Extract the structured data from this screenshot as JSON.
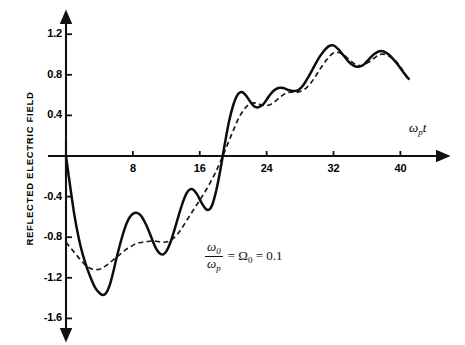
{
  "chart_data": {
    "type": "line",
    "title": "",
    "xlabel": "ω₟t",
    "ylabel": "REFLECTED ELECTRIC FIELD",
    "xlim": [
      0,
      42
    ],
    "ylim": [
      -1.7,
      1.35
    ],
    "grid": false,
    "legend": "none",
    "xticks": [
      8,
      16,
      24,
      32,
      40
    ],
    "xtick_labels": [
      "8",
      "16",
      "24",
      "32",
      "40"
    ],
    "yticks": [
      1.2,
      0.8,
      0.4,
      -0.4,
      -0.8,
      -1.2,
      -1.6
    ],
    "ytick_labels": [
      "1.2",
      "0.8",
      "0.4",
      "-0.4",
      "-0.8",
      "-1.2",
      "-1.6"
    ],
    "annotations": [
      {
        "text": "ω₀/ωₚ = Ω₀ = 0.1",
        "numerator": "ω",
        "numerator_sub": "0",
        "denominator": "ω",
        "denominator_sub": "p",
        "rest": "= Ω",
        "rest_sub": "0",
        "value": "= 0.1",
        "x": 0.49,
        "y": 0.72
      }
    ],
    "series": [
      {
        "name": "solid",
        "style": "solid",
        "points": [
          [
            0.0,
            0.0
          ],
          [
            0.5,
            -0.3
          ],
          [
            1.0,
            -0.58
          ],
          [
            1.5,
            -0.8
          ],
          [
            2.0,
            -0.97
          ],
          [
            2.5,
            -1.1
          ],
          [
            3.0,
            -1.21
          ],
          [
            3.5,
            -1.3
          ],
          [
            4.0,
            -1.35
          ],
          [
            4.4,
            -1.37
          ],
          [
            4.8,
            -1.35
          ],
          [
            5.2,
            -1.28
          ],
          [
            5.6,
            -1.16
          ],
          [
            6.0,
            -1.02
          ],
          [
            6.5,
            -0.86
          ],
          [
            7.0,
            -0.72
          ],
          [
            7.5,
            -0.62
          ],
          [
            8.0,
            -0.57
          ],
          [
            8.5,
            -0.56
          ],
          [
            9.0,
            -0.59
          ],
          [
            9.6,
            -0.68
          ],
          [
            10.2,
            -0.8
          ],
          [
            10.7,
            -0.9
          ],
          [
            11.2,
            -0.96
          ],
          [
            11.6,
            -0.97
          ],
          [
            12.0,
            -0.94
          ],
          [
            12.5,
            -0.85
          ],
          [
            13.0,
            -0.72
          ],
          [
            13.5,
            -0.58
          ],
          [
            14.0,
            -0.45
          ],
          [
            14.4,
            -0.37
          ],
          [
            14.8,
            -0.33
          ],
          [
            15.2,
            -0.33
          ],
          [
            15.7,
            -0.38
          ],
          [
            16.2,
            -0.46
          ],
          [
            16.7,
            -0.52
          ],
          [
            17.1,
            -0.53
          ],
          [
            17.5,
            -0.48
          ],
          [
            18.0,
            -0.33
          ],
          [
            18.5,
            -0.12
          ],
          [
            19.0,
            0.12
          ],
          [
            19.5,
            0.34
          ],
          [
            20.0,
            0.5
          ],
          [
            20.5,
            0.6
          ],
          [
            21.0,
            0.63
          ],
          [
            21.5,
            0.6
          ],
          [
            22.0,
            0.54
          ],
          [
            22.5,
            0.49
          ],
          [
            23.0,
            0.48
          ],
          [
            23.6,
            0.51
          ],
          [
            24.2,
            0.58
          ],
          [
            24.8,
            0.64
          ],
          [
            25.4,
            0.67
          ],
          [
            26.0,
            0.67
          ],
          [
            26.6,
            0.65
          ],
          [
            27.2,
            0.64
          ],
          [
            27.8,
            0.65
          ],
          [
            28.4,
            0.7
          ],
          [
            29.0,
            0.78
          ],
          [
            29.6,
            0.87
          ],
          [
            30.2,
            0.96
          ],
          [
            30.8,
            1.03
          ],
          [
            31.4,
            1.08
          ],
          [
            32.0,
            1.09
          ],
          [
            32.6,
            1.05
          ],
          [
            33.2,
            0.99
          ],
          [
            33.8,
            0.93
          ],
          [
            34.4,
            0.89
          ],
          [
            35.0,
            0.88
          ],
          [
            35.6,
            0.9
          ],
          [
            36.2,
            0.95
          ],
          [
            36.8,
            1.0
          ],
          [
            37.4,
            1.03
          ],
          [
            38.0,
            1.03
          ],
          [
            38.6,
            1.0
          ],
          [
            39.2,
            0.95
          ],
          [
            39.8,
            0.89
          ],
          [
            40.4,
            0.82
          ],
          [
            41.0,
            0.76
          ]
        ]
      },
      {
        "name": "dashed",
        "style": "dashed",
        "points": [
          [
            0.0,
            -0.85
          ],
          [
            0.6,
            -0.91
          ],
          [
            1.2,
            -0.97
          ],
          [
            1.8,
            -1.03
          ],
          [
            2.4,
            -1.08
          ],
          [
            3.0,
            -1.11
          ],
          [
            3.6,
            -1.12
          ],
          [
            4.2,
            -1.11
          ],
          [
            4.8,
            -1.08
          ],
          [
            5.4,
            -1.04
          ],
          [
            6.0,
            -1.0
          ],
          [
            6.6,
            -0.96
          ],
          [
            7.2,
            -0.92
          ],
          [
            7.8,
            -0.89
          ],
          [
            8.5,
            -0.86
          ],
          [
            9.2,
            -0.85
          ],
          [
            10.0,
            -0.84
          ],
          [
            10.8,
            -0.84
          ],
          [
            11.6,
            -0.85
          ],
          [
            12.3,
            -0.84
          ],
          [
            13.0,
            -0.8
          ],
          [
            13.7,
            -0.73
          ],
          [
            14.4,
            -0.64
          ],
          [
            15.1,
            -0.55
          ],
          [
            15.8,
            -0.46
          ],
          [
            16.5,
            -0.37
          ],
          [
            17.2,
            -0.27
          ],
          [
            17.9,
            -0.16
          ],
          [
            18.6,
            -0.03
          ],
          [
            19.3,
            0.11
          ],
          [
            20.0,
            0.25
          ],
          [
            20.7,
            0.38
          ],
          [
            21.4,
            0.47
          ],
          [
            22.1,
            0.52
          ],
          [
            22.8,
            0.52
          ],
          [
            23.5,
            0.5
          ],
          [
            24.2,
            0.5
          ],
          [
            24.9,
            0.53
          ],
          [
            25.6,
            0.58
          ],
          [
            26.3,
            0.62
          ],
          [
            27.0,
            0.63
          ],
          [
            27.7,
            0.63
          ],
          [
            28.4,
            0.65
          ],
          [
            29.1,
            0.7
          ],
          [
            29.8,
            0.78
          ],
          [
            30.5,
            0.87
          ],
          [
            31.2,
            0.95
          ],
          [
            31.9,
            1.01
          ],
          [
            32.6,
            1.02
          ],
          [
            33.3,
            0.99
          ],
          [
            34.0,
            0.94
          ],
          [
            34.7,
            0.9
          ],
          [
            35.4,
            0.89
          ],
          [
            36.1,
            0.92
          ],
          [
            36.8,
            0.96
          ],
          [
            37.5,
            1.0
          ],
          [
            38.2,
            1.0
          ],
          [
            38.9,
            0.97
          ],
          [
            39.6,
            0.92
          ],
          [
            40.3,
            0.84
          ],
          [
            41.0,
            0.74
          ]
        ]
      }
    ]
  },
  "axes": {
    "origin_x_px": 66,
    "origin_y_px": 156,
    "px_per_x_unit": 8.36,
    "px_per_y_unit": 101.5
  }
}
